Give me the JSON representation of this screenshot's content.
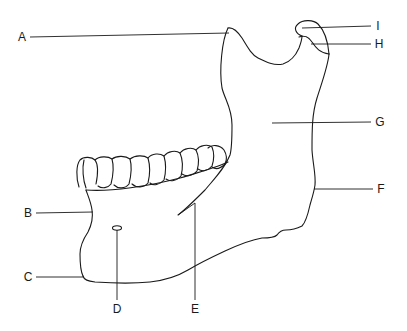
{
  "diagram": {
    "stroke_color": "#1a1a1a",
    "background_color": "#ffffff",
    "labels": [
      {
        "id": "A",
        "text": "A",
        "x": 22,
        "y": 37
      },
      {
        "id": "B",
        "text": "B",
        "x": 28,
        "y": 213
      },
      {
        "id": "C",
        "text": "C",
        "x": 28,
        "y": 277
      },
      {
        "id": "D",
        "text": "D",
        "x": 117,
        "y": 309
      },
      {
        "id": "E",
        "text": "E",
        "x": 195,
        "y": 309
      },
      {
        "id": "F",
        "text": "F",
        "x": 381,
        "y": 189
      },
      {
        "id": "G",
        "text": "G",
        "x": 380,
        "y": 122
      },
      {
        "id": "H",
        "text": "H",
        "x": 379,
        "y": 44
      },
      {
        "id": "I",
        "text": "I",
        "x": 378,
        "y": 26
      }
    ]
  }
}
